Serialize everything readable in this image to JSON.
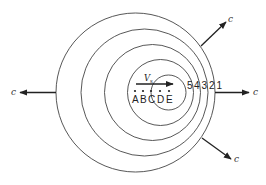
{
  "diagram": {
    "type": "doppler-effect-wavefronts",
    "wavefronts": [
      {
        "id": "1",
        "label": "1",
        "cx": 135.5,
        "cy": 92.5,
        "r": 79.5
      },
      {
        "id": "2",
        "label": "2",
        "cx": 144.5,
        "cy": 92.5,
        "r": 63.5
      },
      {
        "id": "3",
        "label": "3",
        "cx": 152.5,
        "cy": 92.5,
        "r": 48
      },
      {
        "id": "4",
        "label": "4",
        "cx": 160.5,
        "cy": 92.5,
        "r": 33
      },
      {
        "id": "5",
        "label": "5",
        "cx": 168.5,
        "cy": 92.5,
        "r": 17.5
      }
    ],
    "source_positions": [
      {
        "label": "A",
        "x": 135
      },
      {
        "label": "B",
        "x": 143
      },
      {
        "label": "C",
        "x": 151
      },
      {
        "label": "D",
        "x": 160
      },
      {
        "label": "E",
        "x": 169
      }
    ],
    "source_velocity": {
      "label": "V",
      "subscript": "s"
    },
    "wave_speed_label": "c",
    "arrows": [
      {
        "direction": "left",
        "label": "c"
      },
      {
        "direction": "right",
        "label": "c"
      },
      {
        "direction": "upper-right",
        "label": "c"
      },
      {
        "direction": "lower-right",
        "label": "c"
      }
    ],
    "colors": {
      "line": "#444444",
      "arrow": "#222222",
      "background": "#ffffff"
    }
  }
}
